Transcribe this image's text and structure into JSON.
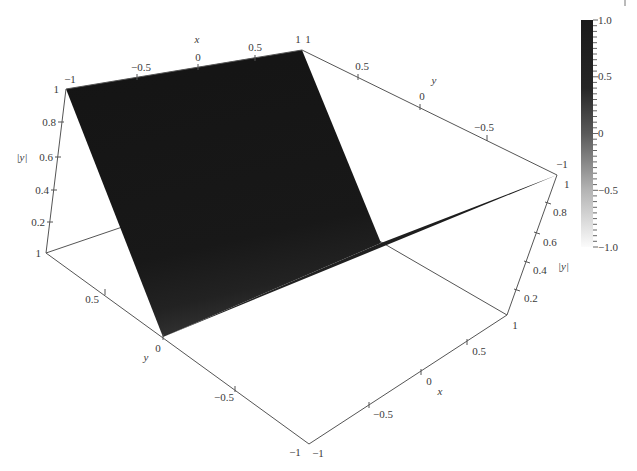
{
  "chart_data": {
    "type": "surface3d",
    "title": "",
    "function": "|y|",
    "x_axis": {
      "label": "x",
      "range": [
        -1,
        1
      ],
      "ticks": [
        "-1",
        "-0.5",
        "0",
        "0.5",
        "1"
      ]
    },
    "y_axis": {
      "label": "y",
      "range": [
        -1,
        1
      ],
      "ticks": [
        "1",
        "0.5",
        "0",
        "-0.5",
        "-1"
      ]
    },
    "z_axis": {
      "label": "|y|",
      "range": [
        0,
        1
      ],
      "ticks": [
        "1",
        "0.8",
        "0.6",
        "0.4",
        "0.2"
      ]
    },
    "surface": {
      "x": [
        -1,
        -0.5,
        0,
        0.5,
        1
      ],
      "y": [
        -1,
        -0.5,
        0,
        0.5,
        1
      ],
      "z_rows_by_y": [
        [
          1,
          1,
          1,
          1,
          1
        ],
        [
          0.5,
          0.5,
          0.5,
          0.5,
          0.5
        ],
        [
          0,
          0,
          0,
          0,
          0
        ],
        [
          0.5,
          0.5,
          0.5,
          0.5,
          0.5
        ],
        [
          1,
          1,
          1,
          1,
          1
        ]
      ]
    },
    "colorbar": {
      "range": [
        -1.0,
        1.0
      ],
      "ticks": [
        "1.0",
        "0.5",
        "0",
        "-0.5",
        "-1.0"
      ],
      "colormap": "grayscale (dark = high, white = low)",
      "minor_step": 0.05
    },
    "grid": false,
    "box": true
  },
  "labels": {
    "top_x": {
      "name": "x",
      "ticks": [
        "−1",
        "−0.5",
        "0",
        "0.5",
        "1"
      ]
    },
    "top_y": {
      "name": "y",
      "ticks": [
        "1",
        "0.5",
        "0",
        "−0.5",
        "−1"
      ]
    },
    "left_z": {
      "name": "|y|",
      "ticks": [
        "1",
        "0.8",
        "0.6",
        "0.4",
        "0.2",
        "1"
      ]
    },
    "front_y": {
      "name": "y",
      "ticks": [
        "0.5",
        "0",
        "−0.5",
        "−1"
      ]
    },
    "front_x": {
      "name": "x",
      "ticks": [
        "−1",
        "−0.5",
        "0",
        "0.5",
        "1"
      ]
    },
    "right_z": {
      "name": "|y|",
      "ticks": [
        "0.2",
        "0.4",
        "0.6",
        "0.8",
        "1"
      ]
    },
    "colorbar": {
      "ticks": [
        "1.0",
        "0.5",
        "0",
        "−0.5",
        "−1.0"
      ]
    }
  },
  "colors": {
    "surface_top": "#141414",
    "surface_bottom": "#2c2c2c",
    "colorbar_top": "#1a1a1a",
    "colorbar_bottom": "#fbfbfb",
    "axis": "#555555"
  }
}
